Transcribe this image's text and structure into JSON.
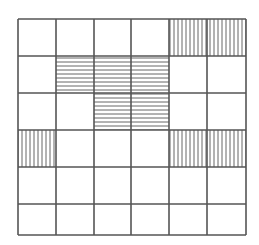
{
  "figure": {
    "type": "grid-diagram",
    "rows": 6,
    "cols": 6,
    "line_color": "#555555",
    "hatch_color": "#666666",
    "background": "#ffffff",
    "col_edges": [
      18,
      56,
      94,
      131,
      169,
      207,
      246
    ],
    "row_edges": [
      19,
      56,
      93,
      130,
      167,
      204,
      235
    ],
    "shaded_cells": [
      {
        "row": 0,
        "col": 4,
        "pattern": "vertical"
      },
      {
        "row": 0,
        "col": 5,
        "pattern": "vertical"
      },
      {
        "row": 1,
        "col": 1,
        "pattern": "horizontal"
      },
      {
        "row": 1,
        "col": 2,
        "pattern": "horizontal"
      },
      {
        "row": 1,
        "col": 3,
        "pattern": "horizontal"
      },
      {
        "row": 2,
        "col": 2,
        "pattern": "horizontal"
      },
      {
        "row": 2,
        "col": 3,
        "pattern": "horizontal"
      },
      {
        "row": 3,
        "col": 0,
        "pattern": "vertical"
      },
      {
        "row": 3,
        "col": 4,
        "pattern": "vertical"
      },
      {
        "row": 3,
        "col": 5,
        "pattern": "vertical"
      }
    ]
  }
}
